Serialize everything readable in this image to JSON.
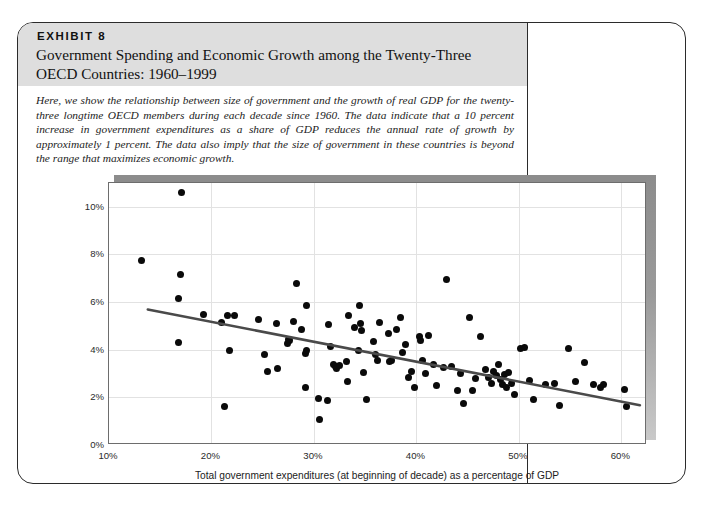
{
  "exhibit": {
    "label": "EXHIBIT 8",
    "title": "Government Spending and Economic Growth among the Twenty-Three OECD Countries: 1960–1999",
    "description": "Here, we show the relationship between size of government and the growth of real GDP for the twenty-three longtime OECD members during each decade since 1960. The data indicate that a 10 percent increase in government expenditures as a share of GDP reduces the annual rate of growth by approximately 1 percent. The data also imply that the size of government in these countries is beyond the range that maximizes economic growth.",
    "sources_prefix": "Sources:",
    "sources_text_1": " OECD, ",
    "sources_italic_1": "OECD Economic Outlook",
    "sources_text_2": " (various issues); and the World Bank, ",
    "sources_italic_2": "World Development Indicators",
    "sources_text_3": ", CD-ROM, 2001."
  },
  "colors": {
    "header_band": "#dedede",
    "border": "#2b2b2b",
    "dot": "#0a0a0a",
    "trendline": "#4a4a4a",
    "gridline": "#e2e2e2",
    "shadow": "#8c8c8c"
  },
  "chart_data": {
    "type": "scatter",
    "title": "Government Spending and Economic Growth among the Twenty-Three OECD Countries: 1960–1999",
    "xlabel": "Total government expenditures (at beginning of decade) as a percentage of GDP",
    "ylabel": "Decade-long growth rate",
    "xlim": [
      10,
      62.5
    ],
    "ylim": [
      0,
      11
    ],
    "xticks": [
      10,
      20,
      30,
      40,
      50,
      60
    ],
    "xticklabels": [
      "10%",
      "20%",
      "30%",
      "40%",
      "50%",
      "60%"
    ],
    "yticks": [
      0,
      2,
      4,
      6,
      8,
      10
    ],
    "yticklabels": [
      "0%",
      "2%",
      "4%",
      "6%",
      "8%",
      "10%"
    ],
    "grid": true,
    "legend": null,
    "trendline": {
      "type": "linear-fit",
      "x_start": 13.8,
      "y_start": 5.65,
      "x_end": 62.0,
      "y_end": 1.6,
      "slope_per_10pct": -0.84,
      "color": "#4a4a4a"
    },
    "annotation": "A 10 percent increase in government expenditures as a share of GDP reduces the annual rate of growth by approximately 1 percent.",
    "points": [
      [
        17.1,
        10.6
      ],
      [
        13.2,
        7.75
      ],
      [
        17.0,
        7.15
      ],
      [
        16.8,
        6.15
      ],
      [
        16.8,
        4.3
      ],
      [
        19.2,
        5.5
      ],
      [
        21.0,
        5.15
      ],
      [
        21.6,
        5.45
      ],
      [
        22.2,
        5.45
      ],
      [
        21.8,
        3.95
      ],
      [
        21.3,
        1.6
      ],
      [
        24.6,
        5.25
      ],
      [
        25.2,
        3.8
      ],
      [
        25.5,
        3.1
      ],
      [
        26.3,
        5.1
      ],
      [
        26.4,
        3.2
      ],
      [
        28.3,
        6.8
      ],
      [
        28.0,
        5.2
      ],
      [
        27.6,
        4.4
      ],
      [
        27.4,
        4.25
      ],
      [
        27.5,
        4.45
      ],
      [
        29.3,
        5.85
      ],
      [
        28.8,
        4.85
      ],
      [
        29.2,
        3.85
      ],
      [
        29.3,
        3.95
      ],
      [
        29.2,
        2.4
      ],
      [
        30.4,
        1.95
      ],
      [
        30.5,
        1.05
      ],
      [
        31.3,
        1.85
      ],
      [
        31.4,
        5.05
      ],
      [
        31.6,
        4.15
      ],
      [
        31.9,
        3.4
      ],
      [
        32.1,
        3.3
      ],
      [
        32.2,
        3.2
      ],
      [
        32.5,
        3.35
      ],
      [
        33.2,
        3.5
      ],
      [
        33.3,
        2.65
      ],
      [
        33.4,
        5.45
      ],
      [
        34.0,
        4.95
      ],
      [
        34.3,
        3.95
      ],
      [
        34.4,
        5.85
      ],
      [
        34.5,
        5.1
      ],
      [
        34.6,
        4.8
      ],
      [
        34.8,
        3.05
      ],
      [
        35.1,
        1.9
      ],
      [
        35.8,
        4.35
      ],
      [
        36.0,
        3.8
      ],
      [
        36.2,
        3.55
      ],
      [
        36.4,
        5.15
      ],
      [
        37.3,
        4.7
      ],
      [
        37.4,
        3.5
      ],
      [
        37.6,
        3.55
      ],
      [
        38.1,
        4.85
      ],
      [
        38.4,
        5.35
      ],
      [
        38.6,
        3.9
      ],
      [
        38.9,
        4.2
      ],
      [
        39.2,
        2.85
      ],
      [
        39.5,
        3.1
      ],
      [
        39.8,
        2.4
      ],
      [
        40.3,
        4.55
      ],
      [
        40.4,
        4.4
      ],
      [
        40.6,
        3.55
      ],
      [
        40.9,
        3.0
      ],
      [
        41.2,
        4.6
      ],
      [
        41.7,
        3.4
      ],
      [
        42.0,
        2.5
      ],
      [
        42.6,
        3.25
      ],
      [
        42.9,
        6.95
      ],
      [
        43.4,
        3.3
      ],
      [
        44.0,
        2.3
      ],
      [
        44.3,
        3.0
      ],
      [
        44.6,
        1.75
      ],
      [
        45.2,
        5.35
      ],
      [
        45.5,
        2.3
      ],
      [
        45.8,
        2.8
      ],
      [
        46.3,
        4.55
      ],
      [
        46.7,
        3.15
      ],
      [
        47.0,
        2.85
      ],
      [
        47.3,
        2.6
      ],
      [
        47.5,
        3.1
      ],
      [
        47.8,
        2.9
      ],
      [
        48.0,
        3.4
      ],
      [
        48.2,
        2.75
      ],
      [
        48.4,
        2.55
      ],
      [
        48.6,
        2.95
      ],
      [
        48.8,
        2.4
      ],
      [
        49.0,
        3.05
      ],
      [
        49.3,
        2.6
      ],
      [
        49.6,
        2.1
      ],
      [
        50.2,
        4.05
      ],
      [
        50.5,
        4.1
      ],
      [
        51.0,
        2.7
      ],
      [
        51.4,
        1.9
      ],
      [
        52.6,
        2.55
      ],
      [
        53.5,
        2.6
      ],
      [
        54.0,
        1.65
      ],
      [
        54.8,
        4.05
      ],
      [
        55.5,
        2.65
      ],
      [
        56.4,
        3.45
      ],
      [
        57.3,
        2.55
      ],
      [
        58.0,
        2.4
      ],
      [
        58.3,
        2.55
      ],
      [
        60.3,
        2.35
      ],
      [
        60.5,
        1.6
      ]
    ]
  }
}
